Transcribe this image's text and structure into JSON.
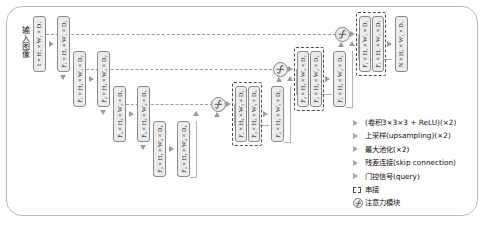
{
  "diagram": {
    "input_label": "输入图像",
    "colors": {
      "box_fill": "#ececec",
      "box_border": "#8a8a8a",
      "arrow": "#9a9a9a",
      "concat_border": "#4a4a4a",
      "frame": "#b9b9b9"
    }
  },
  "encoder": {
    "level1": [
      {
        "id": "enc-1-1",
        "channels": "1",
        "h": "H",
        "h_sub": "1",
        "w": "W",
        "w_sub": "1",
        "d": "D",
        "d_sub": "1",
        "label": "1 × H₁ × W₁ × D₁"
      },
      {
        "id": "enc-1-2",
        "channels": "F",
        "channels_sub": "1",
        "h": "H",
        "h_sub": "1",
        "w": "W",
        "w_sub": "1",
        "d": "D",
        "d_sub": "1",
        "label": "F₁ × H₁ × W₁ × D₁"
      }
    ],
    "level2": [
      {
        "id": "enc-2-1",
        "channels": "F",
        "channels_sub": "1",
        "h": "H",
        "h_sub": "2",
        "w": "W",
        "w_sub": "2",
        "d": "D",
        "d_sub": "2",
        "label": "F₁ × H₂ × W₂ × D₂"
      },
      {
        "id": "enc-2-2",
        "channels": "F",
        "channels_sub": "2",
        "h": "H",
        "h_sub": "2",
        "w": "W",
        "w_sub": "2",
        "d": "D",
        "d_sub": "2",
        "label": "F₂ × H₂ × W₂ × D₂"
      }
    ],
    "level3": [
      {
        "id": "enc-3-1",
        "channels": "F",
        "channels_sub": "2",
        "h": "H",
        "h_sub": "3",
        "w": "W",
        "w_sub": "3",
        "d": "D",
        "d_sub": "3",
        "label": "F₂ × H₃ × W₃ × D₃"
      },
      {
        "id": "enc-3-2",
        "channels": "F",
        "channels_sub": "3",
        "h": "H",
        "h_sub": "3",
        "w": "W",
        "w_sub": "3",
        "d": "D",
        "d_sub": "3",
        "label": "F₃ × H₃ × W₃ × D₃"
      }
    ],
    "level4": [
      {
        "id": "enc-4-1",
        "channels": "F",
        "channels_sub": "3",
        "h": "H",
        "h_sub": "4",
        "w": "W",
        "w_sub": "4",
        "d": "D",
        "d_sub": "4",
        "label": "F₃ × H₄ × W₄ × D₄"
      },
      {
        "id": "enc-4-2",
        "channels": "F",
        "channels_sub": "4",
        "h": "H",
        "h_sub": "4",
        "w": "W",
        "w_sub": "4",
        "d": "D",
        "d_sub": "4",
        "label": "F₄ × H₄ × W₄ × D₄"
      }
    ]
  },
  "decoder": {
    "level3": {
      "concat": [
        {
          "id": "dec-3-c1",
          "channels": "F",
          "channels_sub": "1",
          "h": "H",
          "h_sub": "3",
          "w": "W",
          "w_sub": "3",
          "d": "D",
          "d_sub": "3",
          "label": "F₁ × H₃ × W₃ × D₃"
        },
        {
          "id": "dec-3-c2",
          "channels": "F",
          "channels_sub": "3",
          "h": "H",
          "h_sub": "3",
          "w": "W",
          "w_sub": "3",
          "d": "D",
          "d_sub": "3",
          "label": "F₃ × H₃ × W₃ × D₃"
        }
      ],
      "out": {
        "id": "dec-3-out",
        "channels": "F",
        "channels_sub": "2",
        "h": "H",
        "h_sub": "3",
        "w": "W",
        "w_sub": "3",
        "d": "D",
        "d_sub": "3",
        "label": "F₂ × H₃ × W₃ × D₃"
      }
    },
    "level2": {
      "concat": [
        {
          "id": "dec-2-c1",
          "channels": "F",
          "channels_sub": "2",
          "h": "H",
          "h_sub": "2",
          "w": "W",
          "w_sub": "2",
          "d": "D",
          "d_sub": "2",
          "label": "F₂ × H₂ × W₂ × D₂"
        },
        {
          "id": "dec-2-c2",
          "channels": "F",
          "channels_sub": "2",
          "h": "H",
          "h_sub": "2",
          "w": "W",
          "w_sub": "2",
          "d": "D",
          "d_sub": "2",
          "label": "F₂ × H₂ × W₂ × D₂"
        }
      ],
      "out": {
        "id": "dec-2-out",
        "channels": "F",
        "channels_sub": "1",
        "h": "H",
        "h_sub": "2",
        "w": "W",
        "w_sub": "2",
        "d": "D",
        "d_sub": "2",
        "label": "F₁ × H₂ × W₂ × D₂"
      }
    },
    "level1": {
      "concat": [
        {
          "id": "dec-1-c1",
          "channels": "F",
          "channels_sub": "1",
          "h": "H",
          "h_sub": "1",
          "w": "W",
          "w_sub": "1",
          "d": "D",
          "d_sub": "1",
          "label": "F₁ × H₁ × W₁ × D₁"
        },
        {
          "id": "dec-1-c2",
          "channels": "F",
          "channels_sub": "1",
          "h": "H",
          "h_sub": "1",
          "w": "W",
          "w_sub": "1",
          "d": "D",
          "d_sub": "1",
          "label": "F₁ × H₁ × W₁ × D₁"
        }
      ],
      "out": {
        "id": "dec-1-out",
        "channels": "N",
        "h": "H",
        "h_sub": "1",
        "w": "W",
        "w_sub": "1",
        "d": "D",
        "d_sub": "1",
        "label": "N × H₁ × W₁ × D₁"
      }
    }
  },
  "attention_gates": [
    {
      "id": "att-top",
      "symbol": "sigmoid"
    },
    {
      "id": "att-mid",
      "symbol": "sigmoid"
    },
    {
      "id": "att-low",
      "symbol": "sigmoid"
    }
  ],
  "legend": {
    "items": [
      {
        "marker": "triangle-icon",
        "label": "(卷积3×3×3 + ReLU)(×2)"
      },
      {
        "marker": "triangle-icon",
        "label": "上采样(upsampling)(×2)"
      },
      {
        "marker": "triangle-icon",
        "label": "最大池化(×2)"
      },
      {
        "marker": "triangle-icon",
        "label": "残差连接(skip connection)"
      },
      {
        "marker": "triangle-icon",
        "label": "门控信号(query)"
      },
      {
        "marker": "dashed-box-icon",
        "label": "串接"
      },
      {
        "marker": "attention-circle-icon",
        "label": "注意力模块"
      }
    ]
  }
}
